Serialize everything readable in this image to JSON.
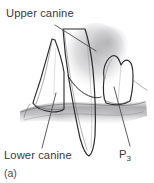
{
  "figure": {
    "caption": "(a)",
    "background_color": "#ffffff",
    "ink_color": "#2b2b2d",
    "label_color": "#3a3a3c",
    "leader_color": "#4d4d50"
  },
  "labels": {
    "upper_canine": {
      "text": "Upper canine",
      "x": 6,
      "y": 17
    },
    "lower_canine": {
      "text": "Lower canine",
      "x": 4,
      "y": 159
    },
    "p3": {
      "text": "P",
      "subscript": "3",
      "x": 119,
      "y": 158
    }
  },
  "leader_lines": [
    {
      "name": "upper-canine-leader",
      "x1": 55,
      "y1": 25,
      "x2": 96,
      "y2": 51
    },
    {
      "name": "lower-canine-leader",
      "x1": 56,
      "y1": 93,
      "x2": 42,
      "y2": 148
    },
    {
      "name": "p3-leader",
      "x1": 114,
      "y1": 87,
      "x2": 130,
      "y2": 146
    }
  ],
  "structures": [
    {
      "name": "upper-canine-tooth",
      "description": "large elongated canine crown descending through centre of figure"
    },
    {
      "name": "lower-canine-tooth",
      "description": "pointed canine crown at left rising from lower jaw"
    },
    {
      "name": "p3-premolar-tooth",
      "description": "blocky third premolar crown at right of lower jaw"
    },
    {
      "name": "lower-jaw-gum-line",
      "description": "horizontal gum and alveolar bone band across middle"
    },
    {
      "name": "upper-gum-shading",
      "description": "soft grey gum tissue above the lower teeth"
    }
  ]
}
